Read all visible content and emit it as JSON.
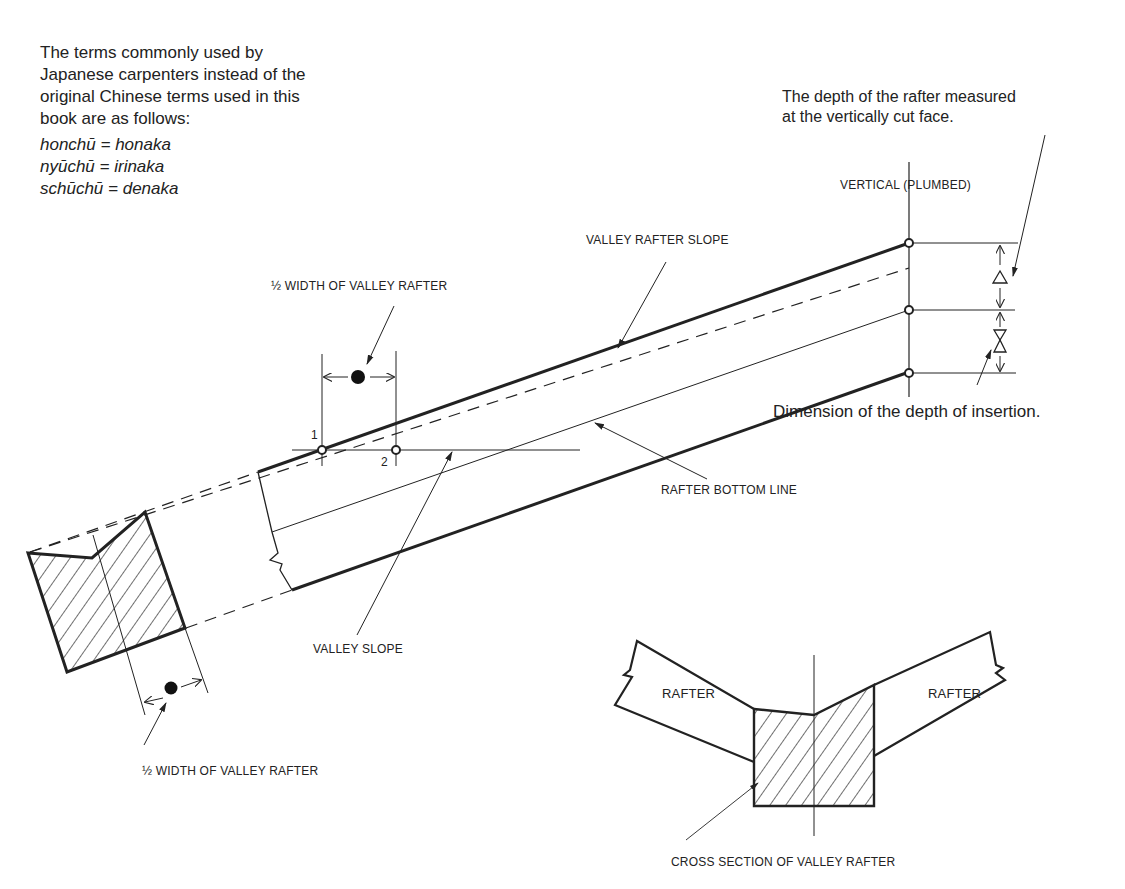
{
  "note_terms": {
    "intro_lines": [
      "The terms commonly used by",
      "Japanese carpenters instead of the",
      "original Chinese terms used in this",
      "book are as follows:"
    ],
    "equivalents": [
      {
        "chinese": "honchū",
        "japanese": "honaka"
      },
      {
        "chinese": "nyūchū",
        "japanese": "irinaka"
      },
      {
        "chinese": "schūchū",
        "japanese": "denaka"
      }
    ],
    "equivalent_lines": [
      "honchū = honaka",
      "nyūchū = irinaka",
      "schūchū = denaka"
    ]
  },
  "labels": {
    "depth_note_line1": "The depth of the rafter measured",
    "depth_note_line2": "at the vertically cut face.",
    "vertical_plumbed": "VERTICAL (PLUMBED)",
    "valley_rafter_slope": "VALLEY RAFTER SLOPE",
    "half_width_top": "½ WIDTH OF VALLEY RAFTER",
    "half_width_bottom": "½ WIDTH OF VALLEY RAFTER",
    "point_1": "1",
    "point_2": "2",
    "insertion_note": "Dimension of the depth of insertion.",
    "rafter_bottom_line": "RAFTER BOTTOM LINE",
    "valley_slope": "VALLEY SLOPE",
    "rafter_left": "RAFTER",
    "rafter_right": "RAFTER",
    "cross_section": "CROSS SECTION OF VALLEY RAFTER"
  },
  "symbols": {
    "depth_symbol": "triangle",
    "insertion_symbol": "hourglass-triangles",
    "half_width_symbol": "filled-dot"
  },
  "colors": {
    "ink": "#222222",
    "background": "#ffffff"
  }
}
